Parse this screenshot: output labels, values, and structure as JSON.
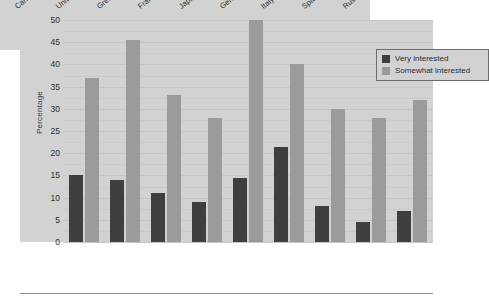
{
  "chart_data": {
    "type": "bar",
    "title": "",
    "xlabel": "",
    "ylabel": "Percentage",
    "ylim": [
      0,
      50
    ],
    "ytick_step": 5,
    "yticks": [
      "50",
      "45",
      "40",
      "35",
      "30",
      "25",
      "20",
      "15",
      "10",
      "5",
      "0"
    ],
    "grid": true,
    "legend_position": "top-right",
    "categories": [
      "Canada",
      "United States",
      "Great Britain",
      "France",
      "Japan",
      "Germany",
      "Italy",
      "Spain",
      "Russia"
    ],
    "series": [
      {
        "name": "Very interested",
        "color": "#3f3f3f",
        "values": [
          15,
          14,
          11,
          9,
          14.5,
          21.5,
          8,
          4.5,
          7
        ]
      },
      {
        "name": "Somewhat interested",
        "color": "#9b9b9b",
        "values": [
          37,
          45.5,
          33,
          28,
          50,
          40,
          30,
          28,
          32
        ]
      }
    ]
  },
  "legend": {
    "items": [
      {
        "label": "Very interested",
        "swatch": "very"
      },
      {
        "label": "Somewhat interested",
        "swatch": "somewhat"
      }
    ]
  },
  "colors": {
    "plot_background": "#d2d2d2",
    "page_background": "#ffffff",
    "gridline": "#c6c6c6",
    "bar_very": "#3f3f3f",
    "bar_somewhat": "#9b9b9b",
    "text": "#2e2e30",
    "rule": "#8e8e99"
  }
}
